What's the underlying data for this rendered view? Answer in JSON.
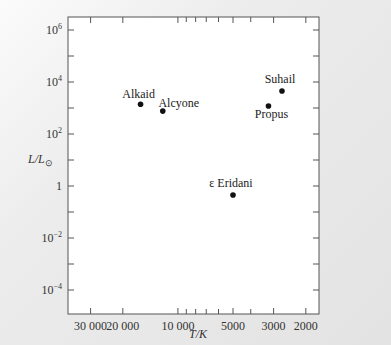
{
  "chart_data": {
    "type": "scatter",
    "title": "",
    "xlabel": "T/K",
    "ylabel": "L/L⊙",
    "x_scale": "log",
    "x_reversed": true,
    "y_scale": "log",
    "xlim": [
      40000,
      1700
    ],
    "ylim": [
      1e-05,
      2000000
    ],
    "grid": false,
    "legend": "none",
    "x_ticks": [
      {
        "value": 30000,
        "label": "30 000"
      },
      {
        "value": 20000,
        "label": "20 000"
      },
      {
        "value": 10000,
        "label": "10 000"
      },
      {
        "value": 5000,
        "label": "5000"
      },
      {
        "value": 3000,
        "label": "3000"
      },
      {
        "value": 2000,
        "label": "2000"
      }
    ],
    "x_minor_ticks": [
      9000,
      8000,
      7000,
      6000,
      4000
    ],
    "y_ticks": [
      {
        "value": 1000000,
        "label": "10",
        "exp": "6"
      },
      {
        "value": 10000,
        "label": "10",
        "exp": "4"
      },
      {
        "value": 100,
        "label": "10",
        "exp": "2"
      },
      {
        "value": 1,
        "label": "1",
        "exp": ""
      },
      {
        "value": 0.01,
        "label": "10",
        "exp": "−2"
      },
      {
        "value": 0.0001,
        "label": "10",
        "exp": "−4"
      }
    ],
    "y_minor_ticks": [
      100000,
      1000,
      10,
      0.1,
      0.001
    ],
    "points": [
      {
        "name": "Alkaid",
        "T": 16000,
        "L": 1400,
        "label_pos": "above-left"
      },
      {
        "name": "Alcyone",
        "T": 12100,
        "L": 760,
        "label_pos": "above-right"
      },
      {
        "name": "Suhail",
        "T": 2700,
        "L": 4500,
        "label_pos": "above"
      },
      {
        "name": "Propus",
        "T": 3200,
        "L": 1200,
        "label_pos": "below"
      },
      {
        "name": "ε Eridani",
        "T": 5000,
        "L": 0.45,
        "label_pos": "above"
      }
    ]
  },
  "labels": {
    "xlabel": "T/K",
    "ylabel_main": "L/L",
    "ylabel_sub": "⊙"
  }
}
